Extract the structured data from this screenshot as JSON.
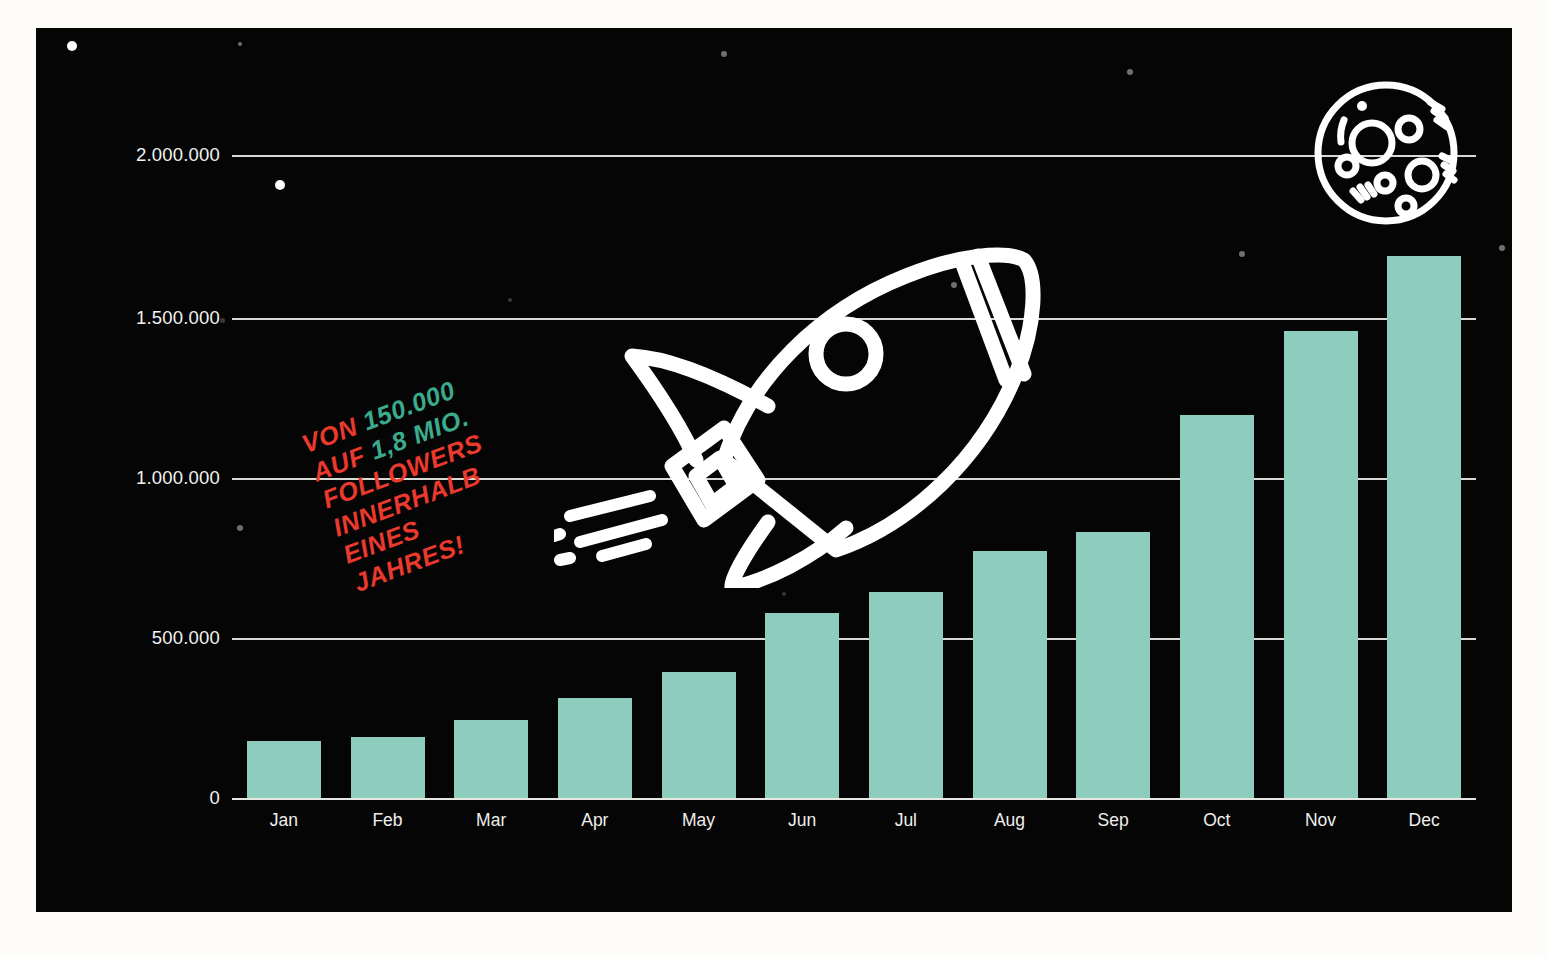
{
  "panel": {
    "background_color": "#050505",
    "page_background_color": "#fdfcf8"
  },
  "colors": {
    "bar": "#8ecdbd",
    "annotation_red": "#ea392d",
    "annotation_accent_teal": "#3aab8c",
    "gridline": "#d8d8d4",
    "axis_text": "#f2f2ef",
    "illustration": "#ffffff"
  },
  "annotation": {
    "name": "growth-callout",
    "rotation_degrees": -20.5,
    "lines": [
      {
        "text": "VON ",
        "accent": "150.000",
        "tail": ""
      },
      {
        "text": "AUF ",
        "accent": "1,8 MIO.",
        "tail": ""
      },
      {
        "text": "FOLLOWERS",
        "accent": "",
        "tail": ""
      },
      {
        "text": "INNERHALB",
        "accent": "",
        "tail": ""
      },
      {
        "text": "EINES",
        "accent": "",
        "tail": ""
      },
      {
        "text": "JAHRES!",
        "accent": "",
        "tail": ""
      }
    ],
    "full_text": "VON 150.000 AUF 1,8 MIO. FOLLOWERS INNERHALB EINES JAHRES!",
    "line1_prefix": "VON",
    "line1_accent": "150.000",
    "line2_prefix": "AUF",
    "line2_accent": "1,8 MIO.",
    "line3": "FOLLOWERS",
    "line4": "INNERHALB",
    "line5": "EINES",
    "line6": "JAHRES!"
  },
  "illustrations": {
    "rocket": {
      "name": "rocket-illustration",
      "color": "#ffffff"
    },
    "moon": {
      "name": "moon-illustration",
      "color": "#ffffff"
    }
  },
  "chart_data": {
    "type": "bar",
    "title": "",
    "subtitle": "",
    "xlabel": "",
    "ylabel": "",
    "categories": [
      "Jan",
      "Feb",
      "Mar",
      "Apr",
      "May",
      "Jun",
      "Jul",
      "Aug",
      "Sep",
      "Oct",
      "Nov",
      "Dec"
    ],
    "values": [
      180000,
      190000,
      245000,
      315000,
      395000,
      580000,
      645000,
      775000,
      835000,
      1200000,
      1465000,
      1700000
    ],
    "series": [
      {
        "name": "Followers",
        "values": [
          180000,
          190000,
          245000,
          315000,
          395000,
          580000,
          645000,
          775000,
          835000,
          1200000,
          1465000,
          1700000
        ]
      }
    ],
    "ylim": [
      0,
      2100000
    ],
    "yticks": [
      0,
      500000,
      1000000,
      1500000,
      2000000
    ],
    "ytick_labels": [
      "0",
      "500.000",
      "1.000.000",
      "1.500.000",
      "2.000.000"
    ],
    "grid": true,
    "legend": false,
    "legend_position": "none",
    "bar_color": "#8ecdbd",
    "annotations": [
      "VON 150.000 AUF 1,8 MIO. FOLLOWERS INNERHALB EINES JAHRES!"
    ]
  },
  "stars": [
    {
      "x": 36,
      "y": 18,
      "r": 5.0,
      "tone": "bright"
    },
    {
      "x": 204,
      "y": 16,
      "r": 2.0,
      "tone": "dim"
    },
    {
      "x": 244,
      "y": 157,
      "r": 5.0,
      "tone": "bright"
    },
    {
      "x": 688,
      "y": 26,
      "r": 3.0,
      "tone": "dim"
    },
    {
      "x": 1094,
      "y": 44,
      "r": 3.0,
      "tone": "dim"
    },
    {
      "x": 1206,
      "y": 226,
      "r": 3.0,
      "tone": "dim"
    },
    {
      "x": 1466,
      "y": 220,
      "r": 3.0,
      "tone": "dim"
    },
    {
      "x": 474,
      "y": 272,
      "r": 2.0,
      "tone": "faint"
    },
    {
      "x": 186,
      "y": 292,
      "r": 2.5,
      "tone": "faint"
    },
    {
      "x": 918,
      "y": 257,
      "r": 3.0,
      "tone": "dim"
    },
    {
      "x": 204,
      "y": 500,
      "r": 3.0,
      "tone": "dim"
    },
    {
      "x": 1292,
      "y": 347,
      "r": 4.0,
      "tone": "bright"
    },
    {
      "x": -8,
      "y": 523,
      "r": 3.0,
      "tone": "dim"
    },
    {
      "x": 748,
      "y": 566,
      "r": 2.0,
      "tone": "faint"
    },
    {
      "x": 1062,
      "y": 640,
      "r": 2.0,
      "tone": "faint"
    },
    {
      "x": 364,
      "y": 790,
      "r": 2.0,
      "tone": "faint"
    }
  ]
}
